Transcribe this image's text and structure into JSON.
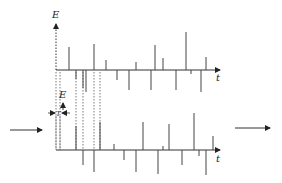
{
  "diagram": {
    "top_axis": {
      "y_label": "E",
      "x_label": "t",
      "origin": [
        56,
        70
      ],
      "x_end": 220,
      "y_top": 24
    },
    "bottom_axis": {
      "y_label": "E",
      "x_label": "t",
      "origin": [
        56,
        150
      ],
      "x_end": 220,
      "y_top": 112,
      "shift_label": "T"
    },
    "top_spikes": [
      {
        "x": 69,
        "y": 47
      },
      {
        "x": 76,
        "y": 79
      },
      {
        "x": 83,
        "y": 88
      },
      {
        "x": 86,
        "y": 92
      },
      {
        "x": 94,
        "y": 44
      },
      {
        "x": 106,
        "y": 60
      },
      {
        "x": 117,
        "y": 80
      },
      {
        "x": 129,
        "y": 90
      },
      {
        "x": 136,
        "y": 62
      },
      {
        "x": 151,
        "y": 90
      },
      {
        "x": 155,
        "y": 45
      },
      {
        "x": 163,
        "y": 58
      },
      {
        "x": 176,
        "y": 90
      },
      {
        "x": 186,
        "y": 32
      },
      {
        "x": 191,
        "y": 74
      },
      {
        "x": 201,
        "y": 92
      },
      {
        "x": 206,
        "y": 57
      }
    ],
    "bottom_spikes": [
      {
        "x": 76,
        "y": 126
      },
      {
        "x": 83,
        "y": 165
      },
      {
        "x": 94,
        "y": 172
      },
      {
        "x": 100,
        "y": 122
      },
      {
        "x": 114,
        "y": 144
      },
      {
        "x": 124,
        "y": 160
      },
      {
        "x": 136,
        "y": 172
      },
      {
        "x": 143,
        "y": 122
      },
      {
        "x": 158,
        "y": 174
      },
      {
        "x": 163,
        "y": 146
      },
      {
        "x": 169,
        "y": 124
      },
      {
        "x": 182,
        "y": 165
      },
      {
        "x": 194,
        "y": 113
      },
      {
        "x": 199,
        "y": 156
      },
      {
        "x": 206,
        "y": 175
      },
      {
        "x": 213,
        "y": 136
      }
    ],
    "dashed_links": [
      56,
      60,
      76,
      83,
      94,
      100
    ],
    "input_arrow": {
      "x1": 10,
      "x2": 42,
      "y": 130
    },
    "output_arrow": {
      "x1": 235,
      "x2": 270,
      "y": 128
    }
  }
}
